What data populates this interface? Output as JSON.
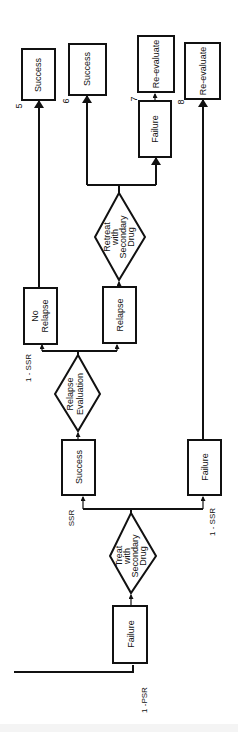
{
  "diagram": {
    "orientation": "rotated 90 degrees counter-clockwise",
    "nodes": {
      "start_failure": {
        "label": "Failure",
        "branch_label": "1 -PSR"
      },
      "treat_decision": {
        "lines": [
          "Treat",
          "with",
          "Secondary",
          "Drug"
        ]
      },
      "success": {
        "label": "Success",
        "branch_label": "SSR"
      },
      "failure_branch": {
        "label": "Failure",
        "branch_label": "1 - SSR"
      },
      "relapse_evaluation": {
        "lines": [
          "Relapse",
          "Evaluation"
        ]
      },
      "no_relapse": {
        "lines": [
          "No",
          "Relapse"
        ],
        "branch_label": "1 - SSR"
      },
      "relapse": {
        "label": "Relapse"
      },
      "retreat_decision": {
        "lines": [
          "Retreat",
          "with",
          "Secondary",
          "Drug"
        ]
      },
      "outcome_5": {
        "label": "Success",
        "number": "5"
      },
      "outcome_6": {
        "label": "Success",
        "number": "6"
      },
      "outcome_7_failure": {
        "label": "Failure"
      },
      "outcome_7": {
        "label": "Re-evaluate",
        "number": "7"
      },
      "outcome_8": {
        "label": "Re-evaluate",
        "number": "8"
      }
    }
  }
}
